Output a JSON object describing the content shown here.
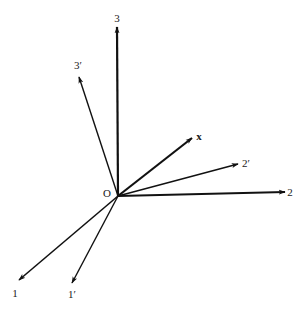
{
  "diagram": {
    "type": "coordinate-axes-rotation",
    "origin": {
      "label": "O",
      "x": 118,
      "y": 196,
      "label_x": 107,
      "label_y": 193
    },
    "colors": {
      "stroke": "#111111",
      "background": "#ffffff"
    },
    "axes": [
      {
        "id": "axis-3",
        "label": "3",
        "tip_x": 117,
        "tip_y": 27,
        "label_x": 117,
        "label_y": 18,
        "bold": false,
        "width": 2.2
      },
      {
        "id": "axis-3-prime",
        "label": "3′",
        "tip_x": 79,
        "tip_y": 77,
        "label_x": 78,
        "label_y": 65,
        "bold": false,
        "width": 1.4
      },
      {
        "id": "vector-x",
        "label": "x",
        "tip_x": 192,
        "tip_y": 138,
        "label_x": 199,
        "label_y": 136,
        "bold": true,
        "width": 2.2
      },
      {
        "id": "axis-2-prime",
        "label": "2′",
        "tip_x": 238,
        "tip_y": 164,
        "label_x": 246,
        "label_y": 163,
        "bold": false,
        "width": 1.4
      },
      {
        "id": "axis-2",
        "label": "2",
        "tip_x": 285,
        "tip_y": 192,
        "label_x": 290,
        "label_y": 192,
        "bold": false,
        "width": 2.2
      },
      {
        "id": "axis-1",
        "label": "1",
        "tip_x": 19,
        "tip_y": 280,
        "label_x": 15,
        "label_y": 293,
        "bold": false,
        "width": 1.6
      },
      {
        "id": "axis-1-prime",
        "label": "1′",
        "tip_x": 72,
        "tip_y": 283,
        "label_x": 72,
        "label_y": 294,
        "bold": false,
        "width": 1.4
      }
    ]
  }
}
